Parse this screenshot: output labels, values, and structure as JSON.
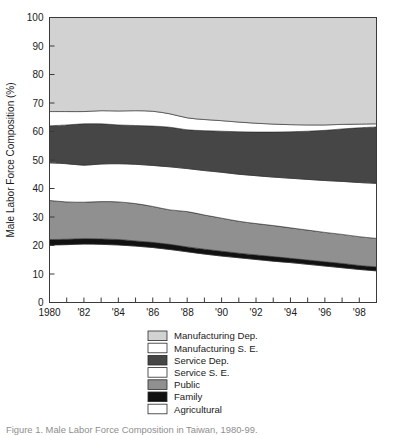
{
  "chart_data": {
    "type": "area",
    "stacked": true,
    "title": "",
    "xlabel": "",
    "ylabel": "Male Labor Force Composition (%)",
    "xlim": [
      1980,
      1999
    ],
    "ylim": [
      0,
      100
    ],
    "grid": false,
    "legend_position": "bottom",
    "x": [
      1980,
      1981,
      1982,
      1983,
      1984,
      1985,
      1986,
      1987,
      1988,
      1989,
      1990,
      1991,
      1992,
      1993,
      1994,
      1995,
      1996,
      1997,
      1998,
      1999
    ],
    "xticklabels": [
      "1980",
      "'82",
      "'84",
      "'86",
      "'88",
      "'90",
      "'92",
      "'94",
      "'96",
      "'98"
    ],
    "xtickvalues": [
      1980,
      1982,
      1984,
      1986,
      1988,
      1990,
      1992,
      1994,
      1996,
      1998
    ],
    "yticklabels": [
      "0",
      "10",
      "20",
      "30",
      "40",
      "50",
      "60",
      "70",
      "80",
      "90",
      "100"
    ],
    "ytickvalues": [
      0,
      10,
      20,
      30,
      40,
      50,
      60,
      70,
      80,
      90,
      100
    ],
    "series": [
      {
        "name": "Agricultural",
        "color": "#ffffff",
        "values": [
          20.2,
          20.3,
          20.5,
          20.4,
          20.2,
          19.8,
          19.3,
          18.6,
          17.8,
          17.0,
          16.3,
          15.7,
          15.1,
          14.5,
          14.0,
          13.4,
          12.8,
          12.2,
          11.6,
          11.1
        ]
      },
      {
        "name": "Family",
        "color": "#111111",
        "values": [
          1.9,
          1.9,
          1.9,
          1.9,
          1.9,
          1.8,
          1.8,
          1.8,
          1.7,
          1.7,
          1.7,
          1.6,
          1.6,
          1.6,
          1.5,
          1.5,
          1.5,
          1.5,
          1.4,
          1.4
        ]
      },
      {
        "name": "Public",
        "color": "#909090",
        "values": [
          13.7,
          13.1,
          12.8,
          13.1,
          13.2,
          13.1,
          12.6,
          12.1,
          12.4,
          12.0,
          11.6,
          11.2,
          11.0,
          10.9,
          10.7,
          10.5,
          10.3,
          10.2,
          10.1,
          10.0
        ]
      },
      {
        "name": "Service S. E.",
        "color": "#ffffff",
        "values": [
          13.2,
          13.4,
          13.0,
          13.2,
          13.4,
          13.8,
          14.4,
          15.1,
          15.1,
          15.6,
          16.1,
          16.5,
          16.8,
          17.0,
          17.4,
          17.8,
          18.2,
          18.6,
          19.0,
          19.3
        ]
      },
      {
        "name": "Service Dep.",
        "color": "#464646",
        "values": [
          13.0,
          13.6,
          14.5,
          14.1,
          13.6,
          13.6,
          13.8,
          13.9,
          13.6,
          14.0,
          14.4,
          14.9,
          15.3,
          15.8,
          16.3,
          16.9,
          17.6,
          18.4,
          19.2,
          19.8
        ]
      },
      {
        "name": "Manufacturing S. E.",
        "color": "#ffffff",
        "values": [
          5.0,
          4.7,
          4.3,
          4.6,
          4.9,
          5.2,
          5.2,
          4.7,
          4.2,
          3.9,
          3.7,
          3.4,
          3.1,
          2.8,
          2.5,
          2.2,
          1.9,
          1.6,
          1.3,
          1.1
        ]
      },
      {
        "name": "Manufacturing Dep.",
        "color": "#d2d2d2",
        "values": [
          33.0,
          33.0,
          33.0,
          32.7,
          32.8,
          32.7,
          32.9,
          33.8,
          35.2,
          35.8,
          36.2,
          36.7,
          37.1,
          37.4,
          37.6,
          37.7,
          37.7,
          37.5,
          37.4,
          37.3
        ]
      }
    ],
    "legend": [
      {
        "label": "Manufacturing Dep.",
        "color": "#d2d2d2"
      },
      {
        "label": "Manufacturing S. E.",
        "color": "#ffffff"
      },
      {
        "label": "Service Dep.",
        "color": "#464646"
      },
      {
        "label": "Service S. E.",
        "color": "#ffffff"
      },
      {
        "label": "Public",
        "color": "#909090"
      },
      {
        "label": "Family",
        "color": "#111111"
      },
      {
        "label": "Agricultural",
        "color": "#ffffff"
      }
    ]
  },
  "caption": {
    "text": "Figure 1.  Male Labor Force Composition in Taiwan, 1980-99."
  }
}
